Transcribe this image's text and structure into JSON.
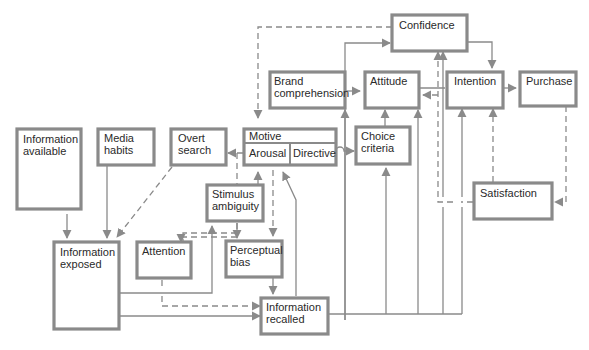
{
  "diagram": {
    "nodes": {
      "information_available": {
        "line1": "Information",
        "line2": "available"
      },
      "media_habits": {
        "line1": "Media",
        "line2": "habits"
      },
      "overt_search": {
        "line1": "Overt",
        "line2": "search"
      },
      "motive": {
        "title": "Motive",
        "left": "Arousal",
        "right": "Directive"
      },
      "brand_comprehension": {
        "line1": "Brand",
        "line2": "comprehension"
      },
      "confidence": {
        "line1": "Confidence"
      },
      "attitude": {
        "line1": "Attitude"
      },
      "intention": {
        "line1": "Intention"
      },
      "purchase": {
        "line1": "Purchase"
      },
      "choice_criteria": {
        "line1": "Choice",
        "line2": "criteria"
      },
      "stimulus_ambiguity": {
        "line1": "Stimulus",
        "line2": "ambiguity"
      },
      "attention": {
        "line1": "Attention"
      },
      "perceptual_bias": {
        "line1": "Perceptual",
        "line2": "bias"
      },
      "information_exposed": {
        "line1": "Information",
        "line2": "exposed"
      },
      "information_recalled": {
        "line1": "Information",
        "line2": "recalled"
      },
      "satisfaction": {
        "line1": "Satisfaction"
      }
    },
    "legend": {
      "solid": "information flow",
      "dashed": "feedback / influence"
    }
  }
}
